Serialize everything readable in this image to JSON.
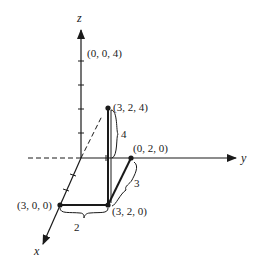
{
  "diagram": {
    "type": "3d-coordinate-axes",
    "axes": {
      "x": {
        "label": "x"
      },
      "y": {
        "label": "y"
      },
      "z": {
        "label": "z"
      }
    },
    "points": [
      {
        "id": "p004",
        "label": "(0, 0, 4)",
        "coords": [
          0,
          0,
          4
        ]
      },
      {
        "id": "p324",
        "label": "(3, 2, 4)",
        "coords": [
          3,
          2,
          4
        ]
      },
      {
        "id": "p020",
        "label": "(0, 2, 0)",
        "coords": [
          0,
          2,
          0
        ]
      },
      {
        "id": "p300",
        "label": "(3, 0, 0)",
        "coords": [
          3,
          0,
          0
        ]
      },
      {
        "id": "p320",
        "label": "(3, 2, 0)",
        "coords": [
          3,
          2,
          0
        ]
      }
    ],
    "dimensions": [
      {
        "id": "dim-x",
        "label": "2",
        "from": "(3, 0, 0)",
        "to": "(3, 2, 0)"
      },
      {
        "id": "dim-y",
        "label": "3",
        "from": "(0, 2, 0)",
        "to": "(3, 2, 0)"
      },
      {
        "id": "dim-z",
        "label": "4",
        "from": "(3, 2, 0)",
        "to": "(3, 2, 4)"
      }
    ],
    "colors": {
      "ink": "#1a1a1a",
      "background": "#ffffff"
    }
  }
}
